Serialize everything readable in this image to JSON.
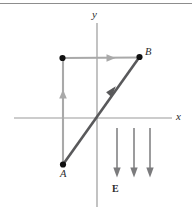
{
  "figure": {
    "width": 192,
    "height": 211,
    "background": "#ffffff",
    "top_rule": {
      "y": 3,
      "x1": 0,
      "x2": 192,
      "color": "#8d8d8d"
    },
    "colors": {
      "axis": "#9a9a9a",
      "light_path": "#a9a9a9",
      "dark_path": "#59595b",
      "field_arrow": "#7b7b7d",
      "dot": "#111111",
      "text": "#2b2b2b"
    },
    "axes": {
      "x_axis": {
        "y": 118,
        "x1": 14,
        "x2": 172
      },
      "y_axis": {
        "x": 97,
        "y1": 23,
        "y2": 207
      },
      "x_label": {
        "text": "x",
        "x": 176,
        "y": 112
      },
      "y_label": {
        "text": "y",
        "x": 92,
        "y": 9
      }
    },
    "points": [
      {
        "name": "A",
        "label": "A",
        "x": 63,
        "y": 164,
        "label_x": 60,
        "label_y": 170
      },
      {
        "name": "corner",
        "label": "",
        "x": 62,
        "y": 58,
        "label_x": 0,
        "label_y": 0
      },
      {
        "name": "B",
        "label": "B",
        "x": 139,
        "y": 57,
        "label_x": 145,
        "label_y": 48
      }
    ],
    "paths": {
      "vertical_leg": {
        "name": "vertical-leg",
        "x1": 63,
        "y1": 164,
        "x2": 63,
        "y2": 58,
        "arrow_at": {
          "x": 63,
          "y": 96
        },
        "direction": "up"
      },
      "horizontal_leg": {
        "name": "horizontal-leg",
        "x1": 63,
        "y1": 58,
        "x2": 139,
        "y2": 57,
        "arrow_at": {
          "x": 112,
          "y": 58
        },
        "direction": "right"
      },
      "diagonal": {
        "name": "diagonal-path",
        "x1": 63,
        "y1": 164,
        "x2": 139,
        "y2": 57,
        "arrow_at": {
          "x": 112,
          "y": 92
        },
        "direction": "up-right"
      }
    },
    "field": {
      "label": "E",
      "label_x": 112,
      "label_y": 185,
      "arrow_top_y": 128,
      "arrow_bottom_y": 176,
      "arrow_xs": [
        117,
        134,
        150
      ]
    }
  }
}
